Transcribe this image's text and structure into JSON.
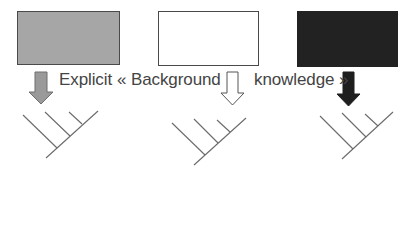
{
  "diagram": {
    "boxes": [
      {
        "id": "grey",
        "fill": "#a6a6a6",
        "x": 17,
        "y": 11,
        "w": 103,
        "h": 54
      },
      {
        "id": "white",
        "fill": "#ffffff",
        "x": 158,
        "y": 11,
        "w": 101,
        "h": 55
      },
      {
        "id": "black",
        "fill": "#222222",
        "x": 297,
        "y": 11,
        "w": 101,
        "h": 56
      }
    ],
    "arrows": [
      {
        "id": "grey-arrow",
        "fill": "#9a9a9a"
      },
      {
        "id": "white-arrow",
        "fill": "#ffffff"
      },
      {
        "id": "black-arrow",
        "fill": "#1e1e1e"
      }
    ],
    "caption": {
      "part1": "Explicit",
      "part2": "« Background",
      "part3": "knowledge »"
    },
    "trees": [
      {
        "id": "tree-1",
        "leaves": 4
      },
      {
        "id": "tree-2",
        "leaves": 4
      },
      {
        "id": "tree-3",
        "leaves": 4
      }
    ]
  }
}
